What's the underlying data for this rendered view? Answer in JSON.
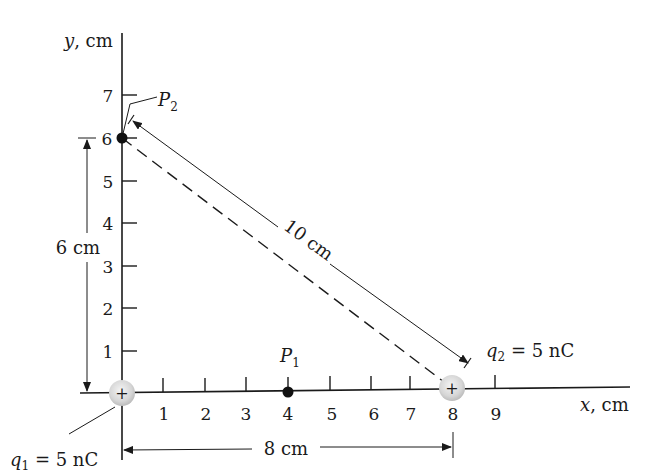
{
  "figure": {
    "axes": {
      "x_label_var": "x",
      "x_label_unit": ", cm",
      "y_label_var": "y",
      "y_label_unit": ", cm",
      "x_ticks": [
        "1",
        "2",
        "3",
        "4",
        "5",
        "6",
        "7",
        "8",
        "9"
      ],
      "y_ticks": [
        "1",
        "2",
        "3",
        "4",
        "5",
        "6",
        "7"
      ]
    },
    "charges": {
      "q1": {
        "symbol": "q",
        "sub": "1",
        "value": " = 5 nC",
        "sign": "+",
        "x_cm": 0,
        "y_cm": 0
      },
      "q2": {
        "symbol": "q",
        "sub": "2",
        "value": " = 5 nC",
        "sign": "+",
        "x_cm": 8,
        "y_cm": 0
      }
    },
    "points": {
      "p1": {
        "symbol": "P",
        "sub": "1",
        "x_cm": 4,
        "y_cm": 0
      },
      "p2": {
        "symbol": "P",
        "sub": "2",
        "x_cm": 0,
        "y_cm": 6
      }
    },
    "dimensions": {
      "horizontal": "8 cm",
      "vertical": "6 cm",
      "diagonal": "10 cm"
    },
    "colors": {
      "line": "#1a1a1a",
      "charge_fill": "#d9d9d9",
      "charge_edge": "#bdbdbd"
    }
  }
}
